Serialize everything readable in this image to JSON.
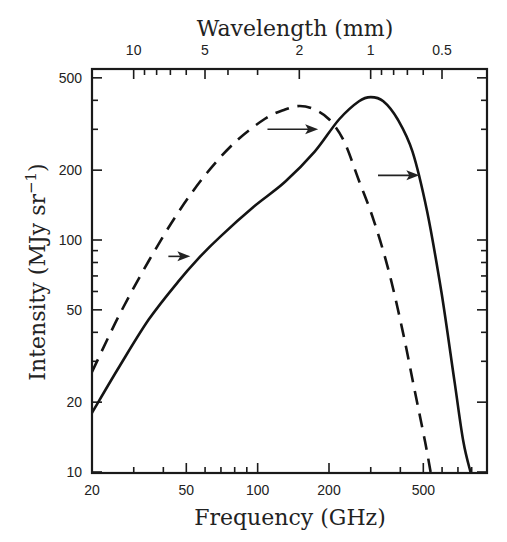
{
  "chart_data": {
    "type": "line",
    "title": "",
    "xlabel": "Frequency (GHz)",
    "ylabel": "Intensity (MJy sr⁻¹)",
    "top_xlabel": "Wavelength (mm)",
    "xscale": "log",
    "yscale": "log",
    "xlim": [
      20,
      900
    ],
    "ylim": [
      10,
      530
    ],
    "grid": false,
    "legend": null,
    "x_ticks": [
      20,
      50,
      100,
      200,
      500
    ],
    "x_tick_labels": [
      "20",
      "50",
      "100",
      "200",
      "500"
    ],
    "y_ticks": [
      10,
      20,
      50,
      100,
      200,
      500
    ],
    "y_tick_labels": [
      "10",
      "20",
      "50",
      "100",
      "200",
      "500"
    ],
    "top_ticks_mm": [
      10,
      5,
      2,
      1,
      0.5
    ],
    "top_tick_labels": [
      "10",
      "5",
      "2",
      "1",
      "0.5"
    ],
    "series": [
      {
        "name": "solid",
        "style": "solid",
        "x": [
          20,
          26.1,
          34.7,
          46.1,
          55.8,
          70.3,
          96.2,
          130.6,
          174.0,
          220.4,
          267.7,
          300.2,
          339.0,
          390.1,
          450.1,
          518.6,
          596.4,
          678.7,
          737.8,
          790.5
        ],
        "y": [
          18.0,
          28.5,
          45.4,
          66.0,
          82.6,
          104.5,
          139.1,
          178.2,
          240.2,
          330.6,
          396.6,
          412.8,
          396.6,
          330.6,
          240.2,
          132.9,
          59.4,
          24.1,
          13.5,
          10.0
        ]
      },
      {
        "name": "dashed",
        "style": "dashed",
        "x": [
          20,
          26.1,
          34.7,
          46.1,
          61.2,
          81.3,
          107.8,
          130.6,
          150.6,
          173.9,
          200.6,
          231.3,
          267.7,
          308.9,
          356.9,
          410.2,
          461.2,
          508.9,
          536.9
        ],
        "y": [
          27.0,
          47.6,
          81.2,
          131.0,
          195.1,
          267.0,
          334.0,
          365.3,
          378.2,
          365.3,
          330.6,
          266.9,
          180.1,
          121.6,
          73.9,
          40.1,
          22.1,
          13.5,
          10.0
        ]
      }
    ],
    "annotations": [
      {
        "type": "arrow",
        "direction": "right",
        "from_x": 42,
        "to_x": 52,
        "y": 85,
        "note": "arrow pointing to solid curve"
      },
      {
        "type": "arrow",
        "direction": "right",
        "from_x": 110,
        "to_x": 180,
        "y": 300,
        "note": "arrow from dashed toward solid near peaks"
      },
      {
        "type": "arrow",
        "direction": "right",
        "from_x": 322,
        "to_x": 481,
        "y": 190,
        "note": "arrow from dashed falloff to solid falloff"
      }
    ]
  },
  "labels": {
    "x_axis_title": "Frequency (GHz)",
    "top_axis_title": "Wavelength (mm)",
    "y_axis_title_main": "Intensity (MJy sr",
    "y_axis_title_sup": "−1",
    "y_axis_title_end": ")"
  },
  "plot_px": {
    "left": 92,
    "top": 69,
    "right": 487,
    "bottom": 473
  },
  "colors": {
    "line": "#141414",
    "frame": "#1a1a1a",
    "background": "#ffffff"
  }
}
